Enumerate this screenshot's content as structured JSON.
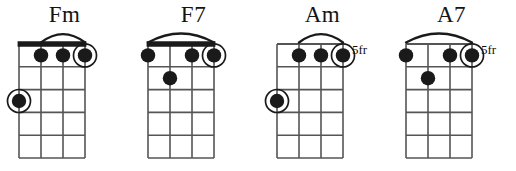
{
  "page": {
    "kind": "chord-chart",
    "instrument_strings": 4,
    "fret_rows": 5,
    "ink_color": "#1a1a1a",
    "grid_color": "#555555",
    "background_color": "#ffffff"
  },
  "chart_data": {
    "type": "table",
    "columns": [
      "chord",
      "position",
      "barre",
      "dots"
    ],
    "chords": [
      {
        "name": "Fm",
        "position_label": "",
        "has_nut": true,
        "barre": {
          "from_string": 2,
          "to_string": 4,
          "fret": 1
        },
        "dots": [
          {
            "string": 2,
            "fret": 1,
            "circled": false
          },
          {
            "string": 3,
            "fret": 1,
            "circled": false
          },
          {
            "string": 4,
            "fret": 1,
            "circled": true
          },
          {
            "string": 1,
            "fret": 3,
            "circled": true
          }
        ]
      },
      {
        "name": "F7",
        "position_label": "",
        "has_nut": true,
        "barre": {
          "from_string": 1,
          "to_string": 4,
          "fret": 1
        },
        "dots": [
          {
            "string": 1,
            "fret": 1,
            "circled": false
          },
          {
            "string": 3,
            "fret": 1,
            "circled": false
          },
          {
            "string": 4,
            "fret": 1,
            "circled": true
          },
          {
            "string": 2,
            "fret": 2,
            "circled": false
          }
        ]
      },
      {
        "name": "Am",
        "position_label": "5fr",
        "has_nut": false,
        "barre": {
          "from_string": 2,
          "to_string": 4,
          "fret": 1
        },
        "dots": [
          {
            "string": 2,
            "fret": 1,
            "circled": false
          },
          {
            "string": 3,
            "fret": 1,
            "circled": false
          },
          {
            "string": 4,
            "fret": 1,
            "circled": true
          },
          {
            "string": 1,
            "fret": 3,
            "circled": true
          }
        ]
      },
      {
        "name": "A7",
        "position_label": "5fr",
        "has_nut": false,
        "barre": {
          "from_string": 1,
          "to_string": 4,
          "fret": 1
        },
        "dots": [
          {
            "string": 1,
            "fret": 1,
            "circled": false
          },
          {
            "string": 3,
            "fret": 1,
            "circled": false
          },
          {
            "string": 4,
            "fret": 1,
            "circled": true
          },
          {
            "string": 2,
            "fret": 2,
            "circled": false
          }
        ]
      }
    ]
  }
}
